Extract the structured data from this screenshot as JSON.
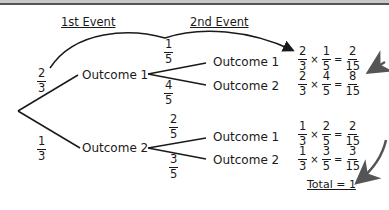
{
  "headings": {
    "first_event": "1st Event",
    "second_event": "2nd Event"
  },
  "first_event": {
    "outcome1": {
      "label": "Outcome 1",
      "prob": {
        "num": "2",
        "den": "3"
      }
    },
    "outcome2": {
      "label": "Outcome 2",
      "prob": {
        "num": "1",
        "den": "3"
      }
    }
  },
  "second_event": {
    "after_outcome1": [
      {
        "label": "Outcome 1",
        "prob": {
          "num": "1",
          "den": "5"
        }
      },
      {
        "label": "Outcome 2",
        "prob": {
          "num": "4",
          "den": "5"
        }
      }
    ],
    "after_outcome2": [
      {
        "label": "Outcome 1",
        "prob": {
          "num": "2",
          "den": "5"
        }
      },
      {
        "label": "Outcome 2",
        "prob": {
          "num": "3",
          "den": "5"
        }
      }
    ]
  },
  "calculations": [
    {
      "a": {
        "num": "2",
        "den": "3"
      },
      "b": {
        "num": "1",
        "den": "5"
      },
      "r": {
        "num": "2",
        "den": "15"
      }
    },
    {
      "a": {
        "num": "2",
        "den": "3"
      },
      "b": {
        "num": "4",
        "den": "5"
      },
      "r": {
        "num": "8",
        "den": "15"
      }
    },
    {
      "a": {
        "num": "1",
        "den": "3"
      },
      "b": {
        "num": "2",
        "den": "5"
      },
      "r": {
        "num": "2",
        "den": "15"
      }
    },
    {
      "a": {
        "num": "1",
        "den": "3"
      },
      "b": {
        "num": "3",
        "den": "5"
      },
      "r": {
        "num": "3",
        "den": "15"
      }
    }
  ],
  "symbols": {
    "times": "×",
    "equals": "="
  },
  "total": "Total = 1",
  "colors": {
    "line": "#1a1a1a",
    "arrow": "#555555"
  }
}
